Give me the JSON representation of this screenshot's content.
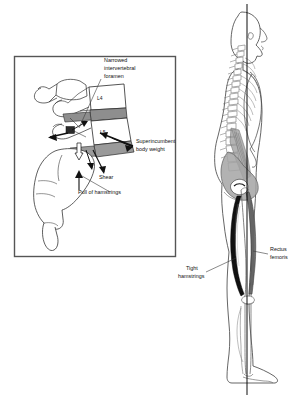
{
  "illustration": {
    "title": "Lumbosacral spine shear and hamstring pull with standing posture figure",
    "background_color": "#ffffff",
    "ink_color": "#1a1a1a"
  },
  "inset_panel": {
    "name": "lumbosacral-detail-panel",
    "border_color": "#555555",
    "fill_color": "#ffffff",
    "labels": {
      "narrowed_foramen_line1": "Narrowed",
      "narrowed_foramen_line2": "intervertebral",
      "narrowed_foramen_line3": "foramen",
      "superincumbent_line1": "Superincumbent",
      "superincumbent_line2": "body weight",
      "shear": "Shear",
      "pull_of_hamstrings": "Pull of hamstrings"
    },
    "vertebra_labels": [
      {
        "name": "vertebra-label-l4",
        "text": "L4"
      },
      {
        "name": "vertebra-label-l5",
        "text": "L5"
      },
      {
        "name": "vertebra-label-s1",
        "text": "S1"
      }
    ],
    "disc_shade_color": "#8e8e8e",
    "wedge_shade_color": "#9a9a9a"
  },
  "standing_figure": {
    "name": "lateral-standing-figure",
    "labels": {
      "rectus_femoris_line1": "Rectus",
      "rectus_femoris_line2": "femoris",
      "tight_hamstrings_line1": "Tight",
      "tight_hamstrings_line2": "hamstrings"
    },
    "muscle_colors": {
      "hamstrings": "#111111",
      "rectus_femoris": "#6e6e6e",
      "psoas_shade": "#8a8a8a",
      "pelvis_shade": "#9d9d9d"
    },
    "plumb_line_color": "#000000",
    "outline_color": "#4a4a4a"
  }
}
